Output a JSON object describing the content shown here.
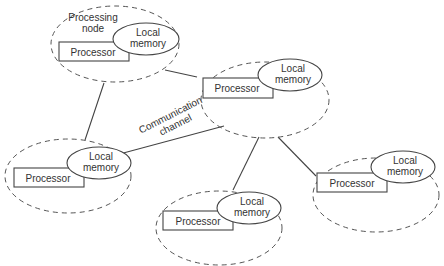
{
  "diagram": {
    "labels": {
      "processing_node": [
        "Processing",
        "node"
      ],
      "communication_channel": [
        "Communication",
        "channel"
      ]
    },
    "nodes": [
      {
        "id": "n1",
        "processor": "Processor",
        "memory": [
          "Local",
          "memory"
        ]
      },
      {
        "id": "n2",
        "processor": "Processor",
        "memory": [
          "Local",
          "memory"
        ]
      },
      {
        "id": "n3",
        "processor": "Processor",
        "memory": [
          "Local",
          "memory"
        ]
      },
      {
        "id": "n4",
        "processor": "Processor",
        "memory": [
          "Local",
          "memory"
        ]
      },
      {
        "id": "n5",
        "processor": "Processor",
        "memory": [
          "Local",
          "memory"
        ]
      }
    ],
    "edges": [
      {
        "from": "n1",
        "to": "n2"
      },
      {
        "from": "n1",
        "to": "n3"
      },
      {
        "from": "n2",
        "to": "n3",
        "label": "Communication channel"
      },
      {
        "from": "n2",
        "to": "n4"
      },
      {
        "from": "n2",
        "to": "n5"
      }
    ],
    "colors": {
      "stroke": "#444444",
      "text": "#333333",
      "background": "#ffffff"
    }
  }
}
